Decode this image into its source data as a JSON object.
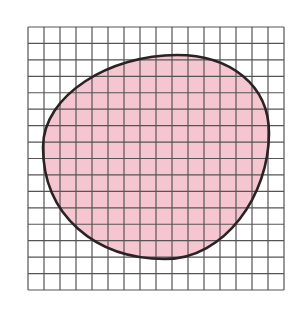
{
  "figure": {
    "grid": {
      "columns": 16,
      "rows": 16,
      "left": 28,
      "top": 27,
      "width": 256,
      "height": 263,
      "line_color": "#555555",
      "background": "#ffffff"
    },
    "shape": {
      "fill_color": "#f5c6cf",
      "stroke_color": "#2a2224",
      "leftmost": [
        43,
        147
      ],
      "topmost": [
        177,
        55
      ],
      "rightmost": [
        269,
        133
      ],
      "bottommost": [
        165,
        259
      ]
    }
  }
}
